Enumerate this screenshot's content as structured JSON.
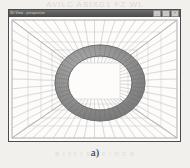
{
  "figure": {
    "caption": "a)",
    "bleed_text_top": "AVILC  ASIXG1  FZ WL",
    "bleed_text_bottom": "a i  t t r  s  o c i  n  s  a"
  },
  "window": {
    "title": "3D View - perspective",
    "controls": [
      {
        "name": "minimize",
        "glyph": "_"
      },
      {
        "name": "maximize",
        "glyph": "□"
      },
      {
        "name": "close",
        "glyph": "×"
      }
    ]
  },
  "colors": {
    "page_background": "#f2f0ed",
    "window_background": "#fbfaf8",
    "window_border": "#4b4b4b",
    "title_bar": "#4a4a4a",
    "title_text": "#d6d6d6",
    "grid_line": "#9a9a9a",
    "grid_line_light": "#bcbcbc",
    "torus_fill": "#8e8e8e",
    "torus_edge": "#6a6a6a",
    "caption_text": "#2d2d2d"
  },
  "scene": {
    "name": "perspective-tunnel-with-torus",
    "description": "Wireframe box corridor rendered in one-point perspective with a shaded torus mesh centered on the vanishing point",
    "vanishing_point": {
      "x": 91,
      "y": 66
    },
    "outer_frame": {
      "x": 3,
      "y": 3,
      "width": 165,
      "height": 118
    },
    "depth_frames": [
      {
        "x": 3,
        "y": 3,
        "width": 165,
        "height": 118
      },
      {
        "x": 19,
        "y": 15,
        "width": 133,
        "height": 94
      },
      {
        "x": 32,
        "y": 25,
        "width": 107,
        "height": 76
      },
      {
        "x": 43,
        "y": 33,
        "width": 85,
        "height": 60
      },
      {
        "x": 52,
        "y": 40,
        "width": 67,
        "height": 47
      },
      {
        "x": 60,
        "y": 46,
        "width": 51,
        "height": 36
      }
    ],
    "grid_divisions_horizontal": 16,
    "grid_divisions_vertical": 12,
    "torus": {
      "center_x": 91,
      "center_y": 66,
      "outer_rx": 45,
      "outer_ry": 38,
      "inner_rx": 32,
      "inner_ry": 27,
      "mesh_segments_u": 48,
      "mesh_segments_v": 6
    }
  }
}
